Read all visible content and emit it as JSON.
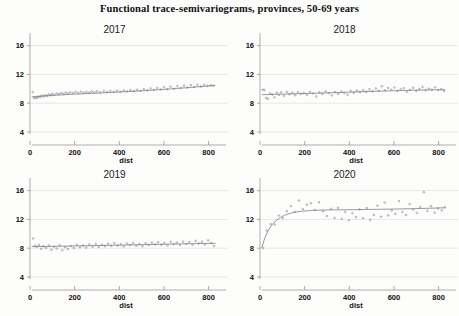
{
  "figure": {
    "title": "Functional trace-semivariograms, provinces, 50-69 years",
    "width": 459,
    "height": 316,
    "background_color": "#fdfdfc",
    "point_color": "#7a7a85",
    "curve_color": "#8f8f97",
    "grid_color": "#d8d8d8",
    "axis_color": "#8a8a8a"
  },
  "chart_data": [
    {
      "type": "scatter",
      "title": "2017",
      "xlabel": "dist",
      "ylabel": "",
      "xlim": [
        0,
        860
      ],
      "ylim": [
        4,
        17.2
      ],
      "xticks": [
        0,
        200,
        400,
        600,
        800
      ],
      "yticks": [
        4,
        8,
        12,
        16
      ],
      "grid": true,
      "legend": "none",
      "points": [
        {
          "x": 12,
          "y": 9.55
        },
        {
          "x": 18,
          "y": 8.72
        },
        {
          "x": 25,
          "y": 8.78
        },
        {
          "x": 31,
          "y": 8.7
        },
        {
          "x": 38,
          "y": 8.92
        },
        {
          "x": 45,
          "y": 8.85
        },
        {
          "x": 52,
          "y": 9.05
        },
        {
          "x": 60,
          "y": 8.95
        },
        {
          "x": 68,
          "y": 9.1
        },
        {
          "x": 76,
          "y": 9.02
        },
        {
          "x": 84,
          "y": 9.22
        },
        {
          "x": 92,
          "y": 9.12
        },
        {
          "x": 100,
          "y": 9.3
        },
        {
          "x": 110,
          "y": 9.18
        },
        {
          "x": 120,
          "y": 9.35
        },
        {
          "x": 130,
          "y": 9.25
        },
        {
          "x": 140,
          "y": 9.42
        },
        {
          "x": 150,
          "y": 9.3
        },
        {
          "x": 160,
          "y": 9.48
        },
        {
          "x": 170,
          "y": 9.35
        },
        {
          "x": 180,
          "y": 9.52
        },
        {
          "x": 192,
          "y": 9.4
        },
        {
          "x": 204,
          "y": 9.55
        },
        {
          "x": 216,
          "y": 9.42
        },
        {
          "x": 228,
          "y": 9.6
        },
        {
          "x": 240,
          "y": 9.45
        },
        {
          "x": 252,
          "y": 9.58
        },
        {
          "x": 264,
          "y": 9.48
        },
        {
          "x": 276,
          "y": 9.62
        },
        {
          "x": 288,
          "y": 9.5
        },
        {
          "x": 300,
          "y": 9.65
        },
        {
          "x": 315,
          "y": 9.52
        },
        {
          "x": 330,
          "y": 9.7
        },
        {
          "x": 345,
          "y": 9.55
        },
        {
          "x": 360,
          "y": 9.72
        },
        {
          "x": 375,
          "y": 9.58
        },
        {
          "x": 390,
          "y": 9.75
        },
        {
          "x": 405,
          "y": 9.6
        },
        {
          "x": 420,
          "y": 9.78
        },
        {
          "x": 435,
          "y": 9.65
        },
        {
          "x": 450,
          "y": 9.82
        },
        {
          "x": 465,
          "y": 9.68
        },
        {
          "x": 480,
          "y": 9.88
        },
        {
          "x": 495,
          "y": 9.72
        },
        {
          "x": 510,
          "y": 9.95
        },
        {
          "x": 525,
          "y": 9.78
        },
        {
          "x": 540,
          "y": 10.05
        },
        {
          "x": 555,
          "y": 9.85
        },
        {
          "x": 570,
          "y": 10.1
        },
        {
          "x": 585,
          "y": 9.9
        },
        {
          "x": 600,
          "y": 10.22
        },
        {
          "x": 615,
          "y": 9.95
        },
        {
          "x": 630,
          "y": 10.3
        },
        {
          "x": 645,
          "y": 10.02
        },
        {
          "x": 660,
          "y": 10.38
        },
        {
          "x": 675,
          "y": 10.1
        },
        {
          "x": 690,
          "y": 10.45
        },
        {
          "x": 705,
          "y": 10.18
        },
        {
          "x": 720,
          "y": 10.52
        },
        {
          "x": 735,
          "y": 10.25
        },
        {
          "x": 750,
          "y": 10.58
        },
        {
          "x": 765,
          "y": 10.32
        },
        {
          "x": 780,
          "y": 10.55
        },
        {
          "x": 795,
          "y": 10.4
        },
        {
          "x": 810,
          "y": 10.48
        },
        {
          "x": 822,
          "y": 10.42
        }
      ],
      "fit_curve": [
        {
          "x": 8,
          "y": 8.9
        },
        {
          "x": 60,
          "y": 9.0
        },
        {
          "x": 120,
          "y": 9.12
        },
        {
          "x": 200,
          "y": 9.26
        },
        {
          "x": 300,
          "y": 9.4
        },
        {
          "x": 400,
          "y": 9.55
        },
        {
          "x": 500,
          "y": 9.72
        },
        {
          "x": 600,
          "y": 9.92
        },
        {
          "x": 700,
          "y": 10.15
        },
        {
          "x": 800,
          "y": 10.4
        },
        {
          "x": 830,
          "y": 10.48
        }
      ]
    },
    {
      "type": "scatter",
      "title": "2018",
      "xlabel": "dist",
      "ylabel": "",
      "xlim": [
        0,
        860
      ],
      "ylim": [
        4,
        17.2
      ],
      "xticks": [
        0,
        200,
        400,
        600,
        800
      ],
      "yticks": [
        4,
        8,
        12,
        16
      ],
      "grid": true,
      "legend": "none",
      "points": [
        {
          "x": 12,
          "y": 9.88
        },
        {
          "x": 20,
          "y": 9.82
        },
        {
          "x": 28,
          "y": 8.72
        },
        {
          "x": 36,
          "y": 8.62
        },
        {
          "x": 45,
          "y": 9.35
        },
        {
          "x": 55,
          "y": 9.2
        },
        {
          "x": 65,
          "y": 8.8
        },
        {
          "x": 75,
          "y": 9.45
        },
        {
          "x": 85,
          "y": 9.15
        },
        {
          "x": 95,
          "y": 9.52
        },
        {
          "x": 108,
          "y": 9.05
        },
        {
          "x": 120,
          "y": 9.58
        },
        {
          "x": 132,
          "y": 9.25
        },
        {
          "x": 145,
          "y": 9.48
        },
        {
          "x": 158,
          "y": 9.12
        },
        {
          "x": 170,
          "y": 9.55
        },
        {
          "x": 183,
          "y": 9.3
        },
        {
          "x": 196,
          "y": 9.42
        },
        {
          "x": 210,
          "y": 9.18
        },
        {
          "x": 224,
          "y": 9.6
        },
        {
          "x": 238,
          "y": 9.35
        },
        {
          "x": 252,
          "y": 8.95
        },
        {
          "x": 266,
          "y": 9.5
        },
        {
          "x": 280,
          "y": 9.28
        },
        {
          "x": 294,
          "y": 9.65
        },
        {
          "x": 308,
          "y": 9.38
        },
        {
          "x": 322,
          "y": 9.08
        },
        {
          "x": 336,
          "y": 9.55
        },
        {
          "x": 350,
          "y": 9.3
        },
        {
          "x": 364,
          "y": 9.62
        },
        {
          "x": 378,
          "y": 9.4
        },
        {
          "x": 392,
          "y": 9.18
        },
        {
          "x": 406,
          "y": 9.7
        },
        {
          "x": 420,
          "y": 9.45
        },
        {
          "x": 434,
          "y": 9.75
        },
        {
          "x": 448,
          "y": 9.52
        },
        {
          "x": 462,
          "y": 9.8
        },
        {
          "x": 476,
          "y": 9.58
        },
        {
          "x": 490,
          "y": 9.92
        },
        {
          "x": 504,
          "y": 9.65
        },
        {
          "x": 518,
          "y": 10.05
        },
        {
          "x": 532,
          "y": 9.72
        },
        {
          "x": 546,
          "y": 10.35
        },
        {
          "x": 560,
          "y": 9.8
        },
        {
          "x": 574,
          "y": 10.12
        },
        {
          "x": 588,
          "y": 9.88
        },
        {
          "x": 602,
          "y": 10.18
        },
        {
          "x": 616,
          "y": 9.7
        },
        {
          "x": 630,
          "y": 9.95
        },
        {
          "x": 644,
          "y": 10.08
        },
        {
          "x": 658,
          "y": 9.6
        },
        {
          "x": 672,
          "y": 9.85
        },
        {
          "x": 686,
          "y": 10.15
        },
        {
          "x": 700,
          "y": 9.72
        },
        {
          "x": 714,
          "y": 9.98
        },
        {
          "x": 728,
          "y": 10.25
        },
        {
          "x": 742,
          "y": 9.78
        },
        {
          "x": 756,
          "y": 10.02
        },
        {
          "x": 770,
          "y": 9.88
        },
        {
          "x": 784,
          "y": 10.2
        },
        {
          "x": 798,
          "y": 9.82
        },
        {
          "x": 812,
          "y": 9.95
        },
        {
          "x": 824,
          "y": 9.7
        }
      ],
      "fit_curve": [
        {
          "x": 8,
          "y": 9.18
        },
        {
          "x": 80,
          "y": 9.25
        },
        {
          "x": 180,
          "y": 9.33
        },
        {
          "x": 280,
          "y": 9.42
        },
        {
          "x": 380,
          "y": 9.52
        },
        {
          "x": 480,
          "y": 9.62
        },
        {
          "x": 580,
          "y": 9.72
        },
        {
          "x": 680,
          "y": 9.8
        },
        {
          "x": 780,
          "y": 9.86
        },
        {
          "x": 830,
          "y": 9.88
        }
      ]
    },
    {
      "type": "scatter",
      "title": "2019",
      "xlabel": "dist",
      "ylabel": "",
      "xlim": [
        0,
        860
      ],
      "ylim": [
        4,
        17.2
      ],
      "xticks": [
        0,
        200,
        400,
        600,
        800
      ],
      "yticks": [
        4,
        8,
        12,
        16
      ],
      "grid": true,
      "legend": "none",
      "points": [
        {
          "x": 14,
          "y": 9.35
        },
        {
          "x": 22,
          "y": 8.35
        },
        {
          "x": 30,
          "y": 8.18
        },
        {
          "x": 40,
          "y": 8.45
        },
        {
          "x": 50,
          "y": 7.92
        },
        {
          "x": 60,
          "y": 8.28
        },
        {
          "x": 72,
          "y": 8.05
        },
        {
          "x": 84,
          "y": 8.38
        },
        {
          "x": 96,
          "y": 7.8
        },
        {
          "x": 108,
          "y": 8.22
        },
        {
          "x": 120,
          "y": 7.95
        },
        {
          "x": 132,
          "y": 8.42
        },
        {
          "x": 145,
          "y": 7.72
        },
        {
          "x": 158,
          "y": 8.15
        },
        {
          "x": 170,
          "y": 7.88
        },
        {
          "x": 183,
          "y": 8.32
        },
        {
          "x": 196,
          "y": 8.02
        },
        {
          "x": 210,
          "y": 8.48
        },
        {
          "x": 224,
          "y": 8.12
        },
        {
          "x": 238,
          "y": 8.38
        },
        {
          "x": 252,
          "y": 8.08
        },
        {
          "x": 266,
          "y": 8.52
        },
        {
          "x": 280,
          "y": 8.22
        },
        {
          "x": 294,
          "y": 8.58
        },
        {
          "x": 308,
          "y": 8.18
        },
        {
          "x": 322,
          "y": 8.45
        },
        {
          "x": 336,
          "y": 8.28
        },
        {
          "x": 350,
          "y": 8.62
        },
        {
          "x": 364,
          "y": 8.32
        },
        {
          "x": 378,
          "y": 8.7
        },
        {
          "x": 392,
          "y": 8.38
        },
        {
          "x": 406,
          "y": 8.55
        },
        {
          "x": 420,
          "y": 8.25
        },
        {
          "x": 434,
          "y": 8.65
        },
        {
          "x": 448,
          "y": 8.42
        },
        {
          "x": 462,
          "y": 8.72
        },
        {
          "x": 476,
          "y": 8.35
        },
        {
          "x": 490,
          "y": 8.58
        },
        {
          "x": 504,
          "y": 8.28
        },
        {
          "x": 518,
          "y": 8.68
        },
        {
          "x": 532,
          "y": 8.45
        },
        {
          "x": 546,
          "y": 8.78
        },
        {
          "x": 560,
          "y": 8.52
        },
        {
          "x": 574,
          "y": 8.82
        },
        {
          "x": 588,
          "y": 8.48
        },
        {
          "x": 602,
          "y": 8.72
        },
        {
          "x": 616,
          "y": 8.38
        },
        {
          "x": 630,
          "y": 8.88
        },
        {
          "x": 644,
          "y": 8.55
        },
        {
          "x": 658,
          "y": 8.78
        },
        {
          "x": 672,
          "y": 8.42
        },
        {
          "x": 686,
          "y": 8.92
        },
        {
          "x": 700,
          "y": 8.6
        },
        {
          "x": 714,
          "y": 8.85
        },
        {
          "x": 728,
          "y": 8.48
        },
        {
          "x": 742,
          "y": 9.02
        },
        {
          "x": 756,
          "y": 8.65
        },
        {
          "x": 770,
          "y": 8.9
        },
        {
          "x": 784,
          "y": 8.52
        },
        {
          "x": 798,
          "y": 9.08
        },
        {
          "x": 812,
          "y": 8.72
        },
        {
          "x": 824,
          "y": 8.3
        }
      ],
      "fit_curve": [
        {
          "x": 8,
          "y": 8.22
        },
        {
          "x": 80,
          "y": 8.25
        },
        {
          "x": 180,
          "y": 8.3
        },
        {
          "x": 280,
          "y": 8.36
        },
        {
          "x": 380,
          "y": 8.42
        },
        {
          "x": 480,
          "y": 8.48
        },
        {
          "x": 580,
          "y": 8.54
        },
        {
          "x": 680,
          "y": 8.6
        },
        {
          "x": 780,
          "y": 8.66
        },
        {
          "x": 830,
          "y": 8.68
        }
      ]
    },
    {
      "type": "scatter",
      "title": "2020",
      "xlabel": "dist",
      "ylabel": "",
      "xlim": [
        0,
        860
      ],
      "ylim": [
        4,
        17.2
      ],
      "xticks": [
        0,
        200,
        400,
        600,
        800
      ],
      "yticks": [
        4,
        8,
        12,
        16
      ],
      "grid": true,
      "legend": "none",
      "points": [
        {
          "x": 14,
          "y": 8.02
        },
        {
          "x": 30,
          "y": 10.45
        },
        {
          "x": 48,
          "y": 11.35
        },
        {
          "x": 66,
          "y": 11.28
        },
        {
          "x": 84,
          "y": 12.55
        },
        {
          "x": 102,
          "y": 12.18
        },
        {
          "x": 120,
          "y": 13.15
        },
        {
          "x": 138,
          "y": 13.85
        },
        {
          "x": 156,
          "y": 13.05
        },
        {
          "x": 174,
          "y": 14.62
        },
        {
          "x": 192,
          "y": 13.42
        },
        {
          "x": 210,
          "y": 14.05
        },
        {
          "x": 228,
          "y": 14.25
        },
        {
          "x": 246,
          "y": 13.32
        },
        {
          "x": 264,
          "y": 14.38
        },
        {
          "x": 282,
          "y": 13.12
        },
        {
          "x": 300,
          "y": 12.45
        },
        {
          "x": 318,
          "y": 13.48
        },
        {
          "x": 334,
          "y": 12.22
        },
        {
          "x": 350,
          "y": 13.62
        },
        {
          "x": 366,
          "y": 12.08
        },
        {
          "x": 382,
          "y": 13.05
        },
        {
          "x": 398,
          "y": 11.88
        },
        {
          "x": 414,
          "y": 12.85
        },
        {
          "x": 430,
          "y": 12.32
        },
        {
          "x": 446,
          "y": 13.38
        },
        {
          "x": 462,
          "y": 12.15
        },
        {
          "x": 478,
          "y": 13.58
        },
        {
          "x": 494,
          "y": 11.95
        },
        {
          "x": 510,
          "y": 12.62
        },
        {
          "x": 526,
          "y": 13.92
        },
        {
          "x": 542,
          "y": 12.38
        },
        {
          "x": 558,
          "y": 14.35
        },
        {
          "x": 574,
          "y": 12.55
        },
        {
          "x": 590,
          "y": 13.28
        },
        {
          "x": 606,
          "y": 12.78
        },
        {
          "x": 622,
          "y": 14.55
        },
        {
          "x": 638,
          "y": 13.05
        },
        {
          "x": 654,
          "y": 12.62
        },
        {
          "x": 670,
          "y": 14.12
        },
        {
          "x": 686,
          "y": 13.38
        },
        {
          "x": 702,
          "y": 12.92
        },
        {
          "x": 718,
          "y": 13.72
        },
        {
          "x": 734,
          "y": 15.78
        },
        {
          "x": 750,
          "y": 13.18
        },
        {
          "x": 766,
          "y": 13.85
        },
        {
          "x": 782,
          "y": 12.95
        },
        {
          "x": 798,
          "y": 13.52
        },
        {
          "x": 814,
          "y": 13.25
        },
        {
          "x": 828,
          "y": 13.68
        }
      ],
      "fit_curve": [
        {
          "x": 8,
          "y": 8.05
        },
        {
          "x": 20,
          "y": 9.3
        },
        {
          "x": 35,
          "y": 10.35
        },
        {
          "x": 50,
          "y": 11.1
        },
        {
          "x": 70,
          "y": 11.8
        },
        {
          "x": 90,
          "y": 12.25
        },
        {
          "x": 110,
          "y": 12.58
        },
        {
          "x": 135,
          "y": 12.85
        },
        {
          "x": 160,
          "y": 13.02
        },
        {
          "x": 190,
          "y": 13.15
        },
        {
          "x": 230,
          "y": 13.25
        },
        {
          "x": 280,
          "y": 13.3
        },
        {
          "x": 340,
          "y": 13.33
        },
        {
          "x": 420,
          "y": 13.36
        },
        {
          "x": 520,
          "y": 13.4
        },
        {
          "x": 620,
          "y": 13.45
        },
        {
          "x": 720,
          "y": 13.52
        },
        {
          "x": 830,
          "y": 13.62
        }
      ]
    }
  ]
}
